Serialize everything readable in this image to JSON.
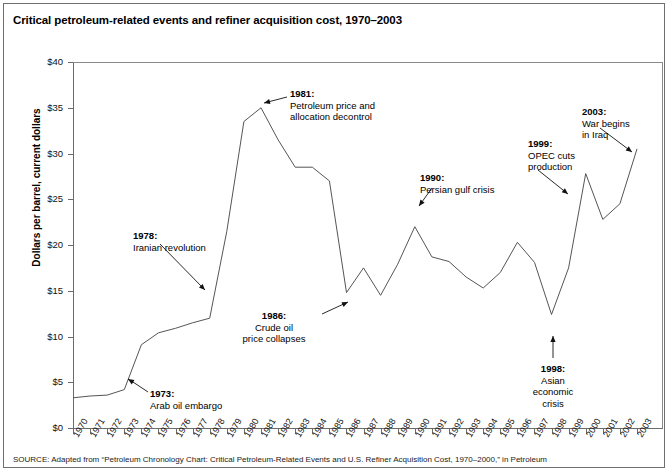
{
  "figure": {
    "title": "Critical petroleum-related events and refiner acquisition cost, 1970–2003",
    "source": "SOURCE: Adapted from “Petroleum Chronology Chart: Critical Petroleum-Related Events and U.S. Refiner Acquisition Cost, 1970–2000,” in Petroleum"
  },
  "chart_data": {
    "type": "line",
    "title": "Critical petroleum-related events and refiner acquisition cost, 1970–2003",
    "xlabel": "",
    "ylabel": "Dollars per barrel, current dollars",
    "xlim": [
      1970,
      2003
    ],
    "ylim": [
      0,
      40
    ],
    "ytick_labels": [
      "$0",
      "$5",
      "$10",
      "$15",
      "$20",
      "$25",
      "$30",
      "$35",
      "$40"
    ],
    "ytick_values": [
      0,
      5,
      10,
      15,
      20,
      25,
      30,
      35,
      40
    ],
    "grid": false,
    "legend": "none",
    "categories": [
      1970,
      1971,
      1972,
      1973,
      1974,
      1975,
      1976,
      1977,
      1978,
      1979,
      1980,
      1981,
      1982,
      1983,
      1984,
      1985,
      1986,
      1987,
      1988,
      1989,
      1990,
      1991,
      1992,
      1993,
      1994,
      1995,
      1996,
      1997,
      1998,
      1999,
      2000,
      2001,
      2002,
      2003
    ],
    "series": [
      {
        "name": "Refiner acquisition cost",
        "values": [
          3.3,
          3.5,
          3.6,
          4.2,
          9.1,
          10.4,
          10.9,
          11.5,
          12.0,
          21.5,
          33.5,
          35.0,
          31.5,
          28.5,
          28.5,
          27.0,
          14.8,
          17.5,
          14.5,
          17.9,
          22.0,
          18.7,
          18.2,
          16.5,
          15.3,
          17.0,
          20.3,
          18.1,
          12.4,
          17.5,
          27.8,
          22.8,
          24.5,
          30.5
        ]
      }
    ],
    "annotations": [
      {
        "id": "1973",
        "year_label": "1973:",
        "text_lines": [
          "Arab oil embargo"
        ],
        "align": "left"
      },
      {
        "id": "1978",
        "year_label": "1978:",
        "text_lines": [
          "Iranian revolution"
        ],
        "align": "left"
      },
      {
        "id": "1981",
        "year_label": "1981:",
        "text_lines": [
          "Petroleum price and",
          "allocation decontrol"
        ],
        "align": "left"
      },
      {
        "id": "1986",
        "year_label": "1986:",
        "text_lines": [
          "Crude oil",
          "price collapses"
        ],
        "align": "center"
      },
      {
        "id": "1990",
        "year_label": "1990:",
        "text_lines": [
          "Persian gulf crisis"
        ],
        "align": "left"
      },
      {
        "id": "1998",
        "year_label": "1998:",
        "text_lines": [
          "Asian",
          "economic",
          "crisis"
        ],
        "align": "center"
      },
      {
        "id": "1999",
        "year_label": "1999:",
        "text_lines": [
          "OPEC cuts",
          "production"
        ],
        "align": "left"
      },
      {
        "id": "2003",
        "year_label": "2003:",
        "text_lines": [
          "War begins",
          "in Iraq"
        ],
        "align": "left"
      }
    ]
  },
  "colors": {
    "line": "#555555",
    "axis": "#6b6b6b",
    "frame": "#6f6f6f",
    "text": "#000000",
    "background": "#ffffff"
  }
}
